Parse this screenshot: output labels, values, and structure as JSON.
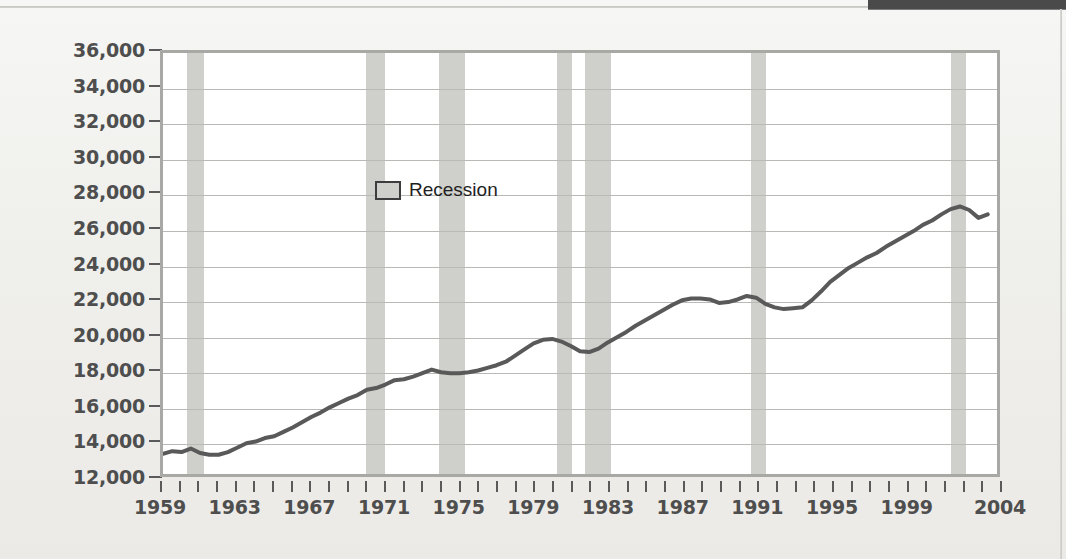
{
  "page": {
    "background_color": "#f2f2f0",
    "top_bar_color": "#4a4a4a"
  },
  "legend": {
    "label": "Recession",
    "swatch_color": "#cfcfcb",
    "position": "inside-top-left"
  },
  "chart_data": {
    "type": "line",
    "title": "",
    "subtitle": "",
    "xlabel": "",
    "ylabel": "Constant (1996) dollars",
    "xlim": [
      1959,
      2004
    ],
    "ylim": [
      12000,
      36000
    ],
    "grid": true,
    "line_color": "#59595a",
    "plot_background": "#ffffff",
    "y_ticks": [
      12000,
      14000,
      16000,
      18000,
      20000,
      22000,
      24000,
      26000,
      28000,
      30000,
      32000,
      34000,
      36000
    ],
    "y_tick_labels": [
      "12,000",
      "14,000",
      "16,000",
      "18,000",
      "20,000",
      "22,000",
      "24,000",
      "26,000",
      "28,000",
      "30,000",
      "32,000",
      "34,000",
      "36,000"
    ],
    "x_ticks": [
      1959,
      1960,
      1961,
      1962,
      1963,
      1964,
      1965,
      1966,
      1967,
      1968,
      1969,
      1970,
      1971,
      1972,
      1973,
      1974,
      1975,
      1976,
      1977,
      1978,
      1979,
      1980,
      1981,
      1982,
      1983,
      1984,
      1985,
      1986,
      1987,
      1988,
      1989,
      1990,
      1991,
      1992,
      1993,
      1994,
      1995,
      1996,
      1997,
      1998,
      1999,
      2000,
      2001,
      2002,
      2003,
      2004
    ],
    "x_tick_labels": [
      "1959",
      "1963",
      "1967",
      "1971",
      "1975",
      "1979",
      "1983",
      "1987",
      "1991",
      "1995",
      "1999",
      "2004"
    ],
    "x_labeled_values": [
      1959,
      1963,
      1967,
      1971,
      1975,
      1979,
      1983,
      1987,
      1991,
      1995,
      1999,
      2004
    ],
    "series": [
      {
        "name": "Constant (1996) dollars per capita disposable income",
        "x": [
          1959.0,
          1959.5,
          1960.0,
          1960.5,
          1961.0,
          1961.5,
          1962.0,
          1962.5,
          1963.0,
          1963.5,
          1964.0,
          1964.5,
          1965.0,
          1965.5,
          1966.0,
          1966.5,
          1967.0,
          1967.5,
          1968.0,
          1968.5,
          1969.0,
          1969.5,
          1970.0,
          1970.5,
          1971.0,
          1971.5,
          1972.0,
          1972.5,
          1973.0,
          1973.5,
          1974.0,
          1974.5,
          1975.0,
          1975.5,
          1976.0,
          1976.5,
          1977.0,
          1977.5,
          1978.0,
          1978.5,
          1979.0,
          1979.5,
          1980.0,
          1980.5,
          1981.0,
          1981.5,
          1982.0,
          1982.5,
          1983.0,
          1983.5,
          1984.0,
          1984.5,
          1985.0,
          1985.5,
          1986.0,
          1986.5,
          1987.0,
          1987.5,
          1988.0,
          1988.5,
          1989.0,
          1989.5,
          1990.0,
          1990.5,
          1991.0,
          1991.5,
          1992.0,
          1992.5,
          1993.0,
          1993.5,
          1994.0,
          1994.5,
          1995.0,
          1995.5,
          1996.0,
          1996.5,
          1997.0,
          1997.5,
          1998.0,
          1998.5,
          1999.0,
          1999.5,
          2000.0,
          2000.5,
          2001.0,
          2001.5,
          2002.0,
          2002.5,
          2003.0,
          2003.5
        ],
        "y": [
          13150,
          13300,
          13250,
          13450,
          13200,
          13100,
          13100,
          13250,
          13500,
          13750,
          13850,
          14050,
          14150,
          14400,
          14650,
          14950,
          15250,
          15500,
          15800,
          16050,
          16300,
          16500,
          16800,
          16900,
          17100,
          17350,
          17400,
          17550,
          17750,
          17950,
          17800,
          17750,
          17750,
          17800,
          17900,
          18050,
          18200,
          18400,
          18750,
          19100,
          19450,
          19650,
          19700,
          19550,
          19300,
          19000,
          18950,
          19150,
          19500,
          19800,
          20100,
          20450,
          20750,
          21050,
          21350,
          21650,
          21900,
          22000,
          22000,
          21950,
          21750,
          21800,
          21950,
          22150,
          22050,
          21700,
          21500,
          21400,
          21450,
          21500,
          21900,
          22400,
          22950,
          23350,
          23750,
          24050,
          24350,
          24600,
          24950,
          25250,
          25550,
          25850,
          26200,
          26450,
          26800,
          27100,
          27250,
          27050,
          26600,
          26800
        ],
        "y_pixel_reference": "values read from gridlines at 2,000-dollar intervals"
      }
    ],
    "recessions": [
      {
        "label": "1960-61 recession",
        "start": 1960.3,
        "end": 1961.2
      },
      {
        "label": "1969-70 recession",
        "start": 1969.9,
        "end": 1970.9
      },
      {
        "label": "1973-75 recession",
        "start": 1973.8,
        "end": 1975.2
      },
      {
        "label": "1980 recession",
        "start": 1980.1,
        "end": 1980.9
      },
      {
        "label": "1981-82 recession",
        "start": 1981.6,
        "end": 1983.0
      },
      {
        "label": "1990-91 recession",
        "start": 1990.5,
        "end": 1991.3
      },
      {
        "label": "2001 recession",
        "start": 2001.2,
        "end": 2002.0
      }
    ]
  }
}
